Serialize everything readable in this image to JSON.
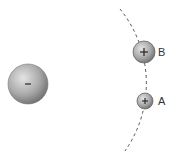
{
  "diagram": {
    "central_charge": {
      "sign": "−",
      "cx": 28,
      "cy": 84,
      "r": 20
    },
    "path": {
      "style": "dashed",
      "center": [
        28,
        84
      ],
      "radius": 118
    },
    "charges": [
      {
        "id": "B",
        "label": "B",
        "sign": "+",
        "cx": 144,
        "cy": 52,
        "r": 11
      },
      {
        "id": "A",
        "label": "A",
        "sign": "+",
        "cx": 145,
        "cy": 101,
        "r": 8
      }
    ],
    "colors": {
      "sphere_light": "#d8d8d8",
      "sphere_dark": "#7a7a7a",
      "line": "#555555",
      "text": "#333333"
    }
  }
}
